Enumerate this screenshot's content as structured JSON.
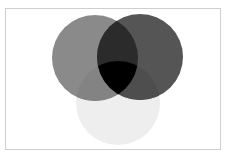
{
  "diagram": {
    "type": "venn",
    "sets": [
      {
        "id": "left",
        "cx": 95,
        "cy": 58,
        "r": 43,
        "fill": "#8a8a8a"
      },
      {
        "id": "right",
        "cx": 140,
        "cy": 57,
        "r": 43,
        "fill": "#555555"
      },
      {
        "id": "bottom",
        "cx": 118,
        "cy": 103,
        "r": 42,
        "fill": "#eeeeee"
      }
    ],
    "intersections": {
      "left_right": "#2b2b2b",
      "left_bottom": "#838383",
      "right_bottom": "#4e4e4e",
      "all": "#000000"
    },
    "frame_border": "#cfcfcf",
    "background": "#ffffff"
  }
}
